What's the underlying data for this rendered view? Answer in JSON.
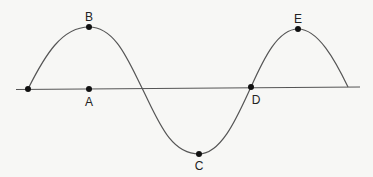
{
  "diagram": {
    "type": "transverse-wave",
    "points": [
      {
        "label": "A",
        "x": 89,
        "y": 89,
        "lx": 89,
        "ly": 106
      },
      {
        "label": "B",
        "x": 89,
        "y": 27,
        "lx": 89,
        "ly": 21
      },
      {
        "label": "C",
        "x": 199,
        "y": 154,
        "lx": 199,
        "ly": 170
      },
      {
        "label": "D",
        "x": 251,
        "y": 87,
        "lx": 256,
        "ly": 103
      },
      {
        "label": "E",
        "x": 298,
        "y": 29,
        "lx": 298,
        "ly": 23
      }
    ],
    "colors": {
      "line": "#555555",
      "point": "#111111",
      "background": "#f7f7f5"
    }
  }
}
